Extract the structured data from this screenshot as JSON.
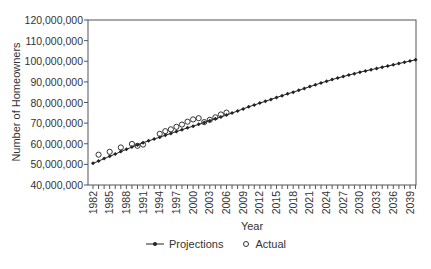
{
  "chart_data": {
    "type": "line",
    "title": "",
    "xlabel": "Year",
    "ylabel": "Number of Homeowners",
    "ylim": [
      40000000,
      120000000
    ],
    "xlim": [
      1982,
      2040
    ],
    "y_ticks": [
      40000000,
      50000000,
      60000000,
      70000000,
      80000000,
      90000000,
      100000000,
      110000000,
      120000000
    ],
    "y_tick_labels": [
      "40,000,000",
      "50,000,000",
      "60,000,000",
      "70,000,000",
      "80,000,000",
      "90,000,000",
      "100,000,000",
      "110,000,000",
      "120,000,000"
    ],
    "x_tick_labels": [
      "1982",
      "1985",
      "1988",
      "1991",
      "1994",
      "1997",
      "2000",
      "2003",
      "2006",
      "2009",
      "2012",
      "2015",
      "2018",
      "2021",
      "2024",
      "2027",
      "2030",
      "2033",
      "2036",
      "2039"
    ],
    "grid": false,
    "legend_position": "bottom",
    "series": [
      {
        "name": "Projections",
        "marker": "filled-diamond-line",
        "x": [
          1982,
          1983,
          1984,
          1985,
          1986,
          1987,
          1988,
          1989,
          1990,
          1991,
          1992,
          1993,
          1994,
          1995,
          1996,
          1997,
          1998,
          1999,
          2000,
          2001,
          2002,
          2003,
          2004,
          2005,
          2006,
          2007,
          2008,
          2009,
          2010,
          2011,
          2012,
          2013,
          2014,
          2015,
          2016,
          2017,
          2018,
          2019,
          2020,
          2021,
          2022,
          2023,
          2024,
          2025,
          2026,
          2027,
          2028,
          2029,
          2030,
          2031,
          2032,
          2033,
          2034,
          2035,
          2036,
          2037,
          2038,
          2039,
          2040
        ],
        "values": [
          50500000,
          51600000,
          52800000,
          53900000,
          55000000,
          56200000,
          57300000,
          58400000,
          59400000,
          60500000,
          61400000,
          62300000,
          63200000,
          64100000,
          65000000,
          65900000,
          66800000,
          67700000,
          68500000,
          69400000,
          70300000,
          71200000,
          72100000,
          73000000,
          73900000,
          74900000,
          75900000,
          76900000,
          77900000,
          78800000,
          79700000,
          80600000,
          81500000,
          82400000,
          83300000,
          84200000,
          85000000,
          85900000,
          86800000,
          87700000,
          88600000,
          89500000,
          90300000,
          91100000,
          91900000,
          92600000,
          93300000,
          94000000,
          94700000,
          95300000,
          95900000,
          96500000,
          97100000,
          97700000,
          98300000,
          98900000,
          99500000,
          100100000,
          100700000
        ]
      },
      {
        "name": "Actual",
        "marker": "open-circle",
        "x": [
          1983,
          1985,
          1987,
          1989,
          1990,
          1991,
          1994,
          1995,
          1996,
          1997,
          1998,
          1999,
          2000,
          2001,
          2002,
          2003,
          2004,
          2005,
          2006
        ],
        "values": [
          54700000,
          56100000,
          58200000,
          59900000,
          59000000,
          59600000,
          64800000,
          66100000,
          67000000,
          68200000,
          69300000,
          70700000,
          71800000,
          72400000,
          70500000,
          71600000,
          72800000,
          74200000,
          75100000
        ]
      }
    ]
  },
  "legend": {
    "projections_label": "Projections",
    "actual_label": "Actual"
  }
}
